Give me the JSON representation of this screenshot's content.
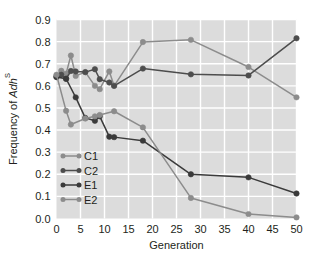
{
  "chart_data": {
    "type": "line",
    "title": "",
    "xlabel": "Generation",
    "ylabel": "Frequency of Adh^S",
    "ylabel_plain": "Frequency of Adh",
    "ylabel_italic_part": "Adh",
    "ylabel_superscript": "S",
    "ylabel_prefix": "Frequency of ",
    "xlim": [
      0,
      50
    ],
    "ylim": [
      0.0,
      0.9
    ],
    "xticks": [
      0,
      5,
      10,
      15,
      20,
      25,
      30,
      35,
      40,
      45,
      50
    ],
    "xtick_labels": [
      "0",
      "5",
      "10",
      "15",
      "20",
      "25",
      "30",
      "35",
      "40",
      "45",
      "50"
    ],
    "yticks": [
      0.0,
      0.1,
      0.2,
      0.3,
      0.4,
      0.5,
      0.6,
      0.7,
      0.8,
      0.9
    ],
    "ytick_labels": [
      "0.0",
      "0.1",
      "0.2",
      "0.3",
      "0.4",
      "0.5",
      "0.6",
      "0.7",
      "0.8",
      "0.9"
    ],
    "grid": true,
    "grid_color": "#ffffff",
    "plot_bg": "#dcdcdc",
    "legend_position": "lower-left",
    "series": [
      {
        "name": "C1",
        "color": "#8c8c8c",
        "x": [
          0,
          1,
          2,
          3,
          4,
          6,
          8,
          9,
          11,
          12,
          18,
          28,
          40,
          50
        ],
        "y": [
          0.645,
          0.668,
          0.655,
          0.737,
          0.645,
          0.662,
          0.6,
          0.585,
          0.665,
          0.6,
          0.798,
          0.808,
          0.685,
          0.548
        ]
      },
      {
        "name": "C2",
        "color": "#4d4d4d",
        "x": [
          0,
          1,
          2,
          3,
          4,
          6,
          8,
          9,
          11,
          12,
          18,
          28,
          40,
          50
        ],
        "y": [
          0.64,
          0.65,
          0.632,
          0.667,
          0.665,
          0.662,
          0.675,
          0.63,
          0.615,
          0.6,
          0.678,
          0.652,
          0.647,
          0.815
        ]
      },
      {
        "name": "E1",
        "color": "#3a3a3a",
        "x": [
          0,
          2,
          4,
          6,
          8,
          9,
          11,
          12,
          18,
          28,
          40,
          50
        ],
        "y": [
          0.64,
          0.632,
          0.548,
          0.455,
          0.442,
          0.462,
          0.37,
          0.368,
          0.352,
          0.2,
          0.186,
          0.113
        ]
      },
      {
        "name": "E2",
        "color": "#8c8c8c",
        "x": [
          0,
          2,
          3,
          6,
          8,
          9,
          12,
          18,
          28,
          40,
          50
        ],
        "y": [
          0.65,
          0.487,
          0.425,
          0.452,
          0.462,
          0.468,
          0.485,
          0.412,
          0.093,
          0.02,
          0.005
        ]
      }
    ],
    "legend_entries": [
      {
        "label": "C1",
        "color": "#8c8c8c"
      },
      {
        "label": "C2",
        "color": "#4d4d4d"
      },
      {
        "label": "E1",
        "color": "#3a3a3a"
      },
      {
        "label": "E2",
        "color": "#8c8c8c"
      }
    ]
  }
}
